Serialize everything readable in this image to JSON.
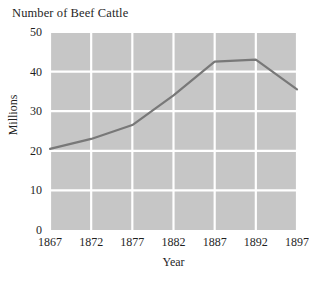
{
  "chart_data": {
    "type": "line",
    "title": "Number of Beef Cattle",
    "xlabel": "Year",
    "ylabel": "Millions",
    "x": [
      1867,
      1872,
      1877,
      1882,
      1887,
      1892,
      1897
    ],
    "categories": [
      "1867",
      "1872",
      "1877",
      "1882",
      "1887",
      "1892",
      "1897"
    ],
    "values": [
      20.5,
      23.0,
      26.5,
      34.0,
      42.5,
      43.0,
      35.5
    ],
    "series": [
      {
        "name": "Number of Beef Cattle",
        "values": [
          20.5,
          23.0,
          26.5,
          34.0,
          42.5,
          43.0,
          35.5
        ]
      }
    ],
    "xlim": [
      1867,
      1897
    ],
    "ylim": [
      0,
      50
    ],
    "ytick_labels": [
      "0",
      "10",
      "20",
      "30",
      "40",
      "50"
    ],
    "ytick_values": [
      0,
      10,
      20,
      30,
      40,
      50
    ],
    "xtick_labels": [
      "1867",
      "1872",
      "1877",
      "1882",
      "1887",
      "1892",
      "1897"
    ],
    "xtick_values": [
      1867,
      1872,
      1877,
      1882,
      1887,
      1892,
      1897
    ],
    "grid": true,
    "legend": "none",
    "colors": {
      "plot_background": "#c6c6c6",
      "gridline": "#ffffff",
      "line": "#787878",
      "text": "#1f1f1f",
      "page_background": "#ffffff"
    }
  }
}
